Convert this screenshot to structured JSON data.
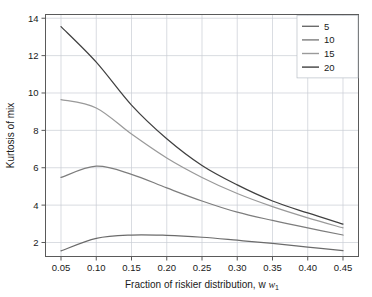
{
  "chart_data": {
    "type": "line",
    "title": "",
    "xlabel": "Fraction of riskier distribution, w",
    "xlabel_subscript": "1",
    "ylabel": "Kurtosis of mix",
    "x": [
      0.05,
      0.1,
      0.15,
      0.2,
      0.25,
      0.3,
      0.35,
      0.4,
      0.45
    ],
    "xlim": [
      0.028,
      0.472
    ],
    "ylim": [
      1.25,
      14.2
    ],
    "xticks": [
      0.05,
      0.1,
      0.15,
      0.2,
      0.25,
      0.3,
      0.35,
      0.4,
      0.45
    ],
    "xtick_labels": [
      "0.05",
      "0.10",
      "0.15",
      "0.20",
      "0.25",
      "0.30",
      "0.35",
      "0.40",
      "0.45"
    ],
    "yticks": [
      2,
      4,
      6,
      8,
      10,
      12,
      14
    ],
    "ytick_labels": [
      "2",
      "4",
      "6",
      "8",
      "10",
      "12",
      "14"
    ],
    "grid": true,
    "legend_position": "top-right",
    "series": [
      {
        "name": "5",
        "color": "#6b6b6b",
        "values": [
          1.55,
          2.22,
          2.4,
          2.38,
          2.28,
          2.12,
          1.95,
          1.75,
          1.56
        ]
      },
      {
        "name": "10",
        "color": "#7d7d7d",
        "values": [
          5.48,
          6.08,
          5.65,
          4.92,
          4.22,
          3.62,
          3.18,
          2.78,
          2.4
        ]
      },
      {
        "name": "15",
        "color": "#9a9a9a",
        "values": [
          9.65,
          9.2,
          7.8,
          6.52,
          5.48,
          4.62,
          3.92,
          3.32,
          2.78
        ]
      },
      {
        "name": "20",
        "color": "#404040",
        "values": [
          13.55,
          11.65,
          9.35,
          7.55,
          6.12,
          5.08,
          4.22,
          3.58,
          2.98
        ]
      }
    ]
  },
  "legend": {
    "entries": [
      "5",
      "10",
      "15",
      "20"
    ]
  }
}
